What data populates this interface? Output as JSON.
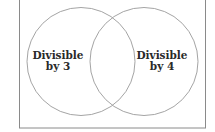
{
  "diagram": {
    "type": "venn",
    "frame": {
      "stroke": "#8a8a8a"
    },
    "circle_stroke": "#9a9a9a",
    "sets": [
      {
        "id": "left",
        "label_line1": "Divisible",
        "label_line2": "by 3"
      },
      {
        "id": "right",
        "label_line1": "Divisible",
        "label_line2": "by 4"
      }
    ]
  }
}
